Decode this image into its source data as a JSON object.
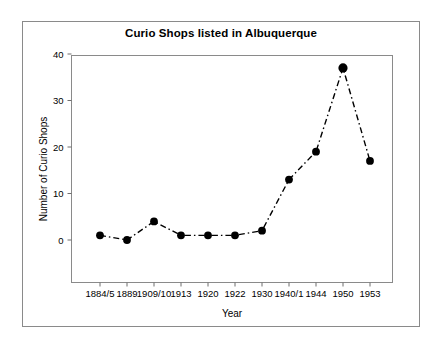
{
  "chart_data": {
    "type": "line",
    "title": "Curio Shops listed in Albuquerque",
    "xlabel": "Year",
    "ylabel": "Number of Curio Shops",
    "categories": [
      "1884/5",
      "1889",
      "1909/10",
      "1913",
      "1920",
      "1922",
      "1930",
      "1940/1",
      "1944",
      "1950",
      "1953"
    ],
    "values": [
      1,
      0,
      4,
      1,
      1,
      1,
      2,
      13,
      19,
      37,
      17
    ],
    "ylim": [
      0,
      40
    ],
    "yticks": [
      0,
      10,
      20,
      30,
      40
    ],
    "ytick_labels": [
      "0",
      "10",
      "20",
      "30",
      "40"
    ],
    "grid": false,
    "legend": false,
    "line_style": "dash-dot",
    "marker": "filled-circle",
    "series_color": "#000000",
    "frame_color": "#8a8a8a",
    "background_color": "#ffffff"
  }
}
